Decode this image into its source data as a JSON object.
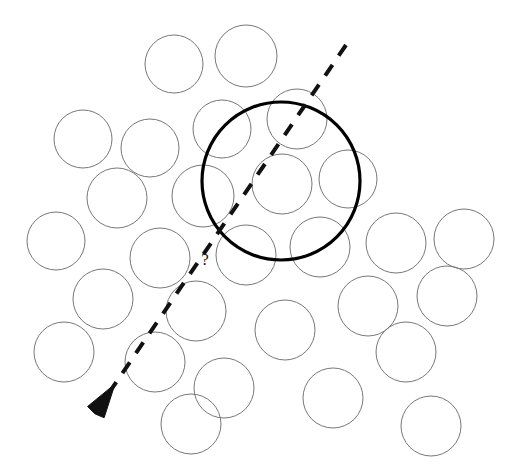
{
  "figure": {
    "background_color": "#ffffff",
    "width": 526,
    "height": 473,
    "query_marker": {
      "label": "?",
      "x": 205,
      "y": 265
    },
    "colors": {
      "packing_stroke": "#777777",
      "highlight_stroke": "#000000",
      "trajectory_stroke": "#111111",
      "label_color": "#1a1a1a",
      "background": "#ffffff"
    }
  },
  "chart_data": {
    "type": "scatter",
    "xlabel": "",
    "ylabel": "",
    "xlim": [
      0,
      526
    ],
    "ylim": [
      0,
      473
    ],
    "grid": false,
    "legend_position": "none",
    "series": [
      {
        "name": "packing-circles",
        "style": "thin-outline",
        "circles": [
          {
            "cx": 174,
            "cy": 64,
            "r": 29
          },
          {
            "cx": 246,
            "cy": 56,
            "r": 31
          },
          {
            "cx": 83,
            "cy": 139,
            "r": 29
          },
          {
            "cx": 150,
            "cy": 148,
            "r": 29
          },
          {
            "cx": 222,
            "cy": 129,
            "r": 29
          },
          {
            "cx": 297,
            "cy": 119,
            "r": 30
          },
          {
            "cx": 117,
            "cy": 198,
            "r": 30
          },
          {
            "cx": 203,
            "cy": 196,
            "r": 31
          },
          {
            "cx": 282,
            "cy": 184,
            "r": 30
          },
          {
            "cx": 348,
            "cy": 179,
            "r": 29
          },
          {
            "cx": 56,
            "cy": 241,
            "r": 29
          },
          {
            "cx": 160,
            "cy": 258,
            "r": 30
          },
          {
            "cx": 246,
            "cy": 255,
            "r": 30
          },
          {
            "cx": 320,
            "cy": 247,
            "r": 30
          },
          {
            "cx": 396,
            "cy": 243,
            "r": 30
          },
          {
            "cx": 464,
            "cy": 239,
            "r": 30
          },
          {
            "cx": 103,
            "cy": 299,
            "r": 30
          },
          {
            "cx": 196,
            "cy": 311,
            "r": 30
          },
          {
            "cx": 285,
            "cy": 330,
            "r": 30
          },
          {
            "cx": 368,
            "cy": 306,
            "r": 30
          },
          {
            "cx": 447,
            "cy": 296,
            "r": 30
          },
          {
            "cx": 155,
            "cy": 362,
            "r": 30
          },
          {
            "cx": 224,
            "cy": 388,
            "r": 30
          },
          {
            "cx": 333,
            "cy": 398,
            "r": 30
          },
          {
            "cx": 406,
            "cy": 352,
            "r": 30
          },
          {
            "cx": 431,
            "cy": 426,
            "r": 30
          },
          {
            "cx": 191,
            "cy": 424,
            "r": 30
          },
          {
            "cx": 64,
            "cy": 352,
            "r": 30
          }
        ]
      },
      {
        "name": "highlight-circle",
        "style": "bold-outline",
        "circles": [
          {
            "cx": 281,
            "cy": 181,
            "r": 79
          }
        ]
      }
    ],
    "annotations": [
      {
        "kind": "dashed-arrow",
        "name": "trajectory",
        "x1": 346,
        "y1": 45,
        "x2": 115,
        "y2": 384,
        "dash_pattern": "13 11",
        "arrow_at": "end"
      },
      {
        "kind": "text",
        "name": "question-mark",
        "text": "?",
        "x": 205,
        "y": 265
      }
    ]
  }
}
